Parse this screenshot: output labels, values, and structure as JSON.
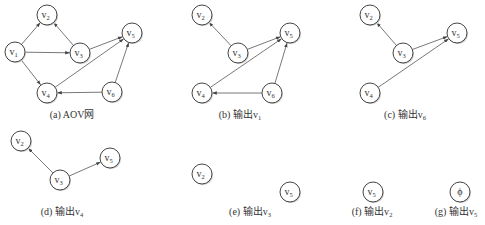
{
  "figure": {
    "node_radius": 10,
    "colors": {
      "node_stroke": "#444444",
      "edge": "#555555",
      "text": "#333333",
      "background": "#ffffff"
    },
    "panels": [
      {
        "id": "a",
        "caption": {
          "prefix": "(a) AOV网",
          "sub": "",
          "x": 72,
          "y": 118
        },
        "nodes": [
          {
            "id": "v1",
            "label": "v",
            "sub": "1",
            "x": 15,
            "y": 52
          },
          {
            "id": "v2",
            "label": "v",
            "sub": "2",
            "x": 47,
            "y": 15
          },
          {
            "id": "v3",
            "label": "v",
            "sub": "3",
            "x": 80,
            "y": 53
          },
          {
            "id": "v4",
            "label": "v",
            "sub": "4",
            "x": 47,
            "y": 93
          },
          {
            "id": "v5",
            "label": "v",
            "sub": "5",
            "x": 132,
            "y": 33
          },
          {
            "id": "v6",
            "label": "v",
            "sub": "6",
            "x": 112,
            "y": 92
          }
        ],
        "edges": [
          {
            "from": "v1",
            "to": "v2"
          },
          {
            "from": "v1",
            "to": "v3"
          },
          {
            "from": "v1",
            "to": "v4"
          },
          {
            "from": "v3",
            "to": "v2"
          },
          {
            "from": "v3",
            "to": "v5"
          },
          {
            "from": "v4",
            "to": "v5"
          },
          {
            "from": "v6",
            "to": "v4"
          },
          {
            "from": "v6",
            "to": "v5"
          }
        ]
      },
      {
        "id": "b",
        "caption": {
          "prefix": "(b) 输出v",
          "sub": "1",
          "x": 240,
          "y": 118
        },
        "nodes": [
          {
            "id": "v2",
            "label": "v",
            "sub": "2",
            "x": 202,
            "y": 15
          },
          {
            "id": "v3",
            "label": "v",
            "sub": "3",
            "x": 238,
            "y": 53
          },
          {
            "id": "v4",
            "label": "v",
            "sub": "4",
            "x": 202,
            "y": 93
          },
          {
            "id": "v5",
            "label": "v",
            "sub": "5",
            "x": 290,
            "y": 33
          },
          {
            "id": "v6",
            "label": "v",
            "sub": "6",
            "x": 272,
            "y": 93
          }
        ],
        "edges": [
          {
            "from": "v3",
            "to": "v2"
          },
          {
            "from": "v3",
            "to": "v5"
          },
          {
            "from": "v4",
            "to": "v5"
          },
          {
            "from": "v6",
            "to": "v4"
          },
          {
            "from": "v6",
            "to": "v5"
          }
        ]
      },
      {
        "id": "c",
        "caption": {
          "prefix": "(c) 输出v",
          "sub": "6",
          "x": 405,
          "y": 118
        },
        "nodes": [
          {
            "id": "v2",
            "label": "v",
            "sub": "2",
            "x": 370,
            "y": 15
          },
          {
            "id": "v3",
            "label": "v",
            "sub": "3",
            "x": 403,
            "y": 53
          },
          {
            "id": "v4",
            "label": "v",
            "sub": "4",
            "x": 370,
            "y": 93
          },
          {
            "id": "v5",
            "label": "v",
            "sub": "5",
            "x": 457,
            "y": 33
          }
        ],
        "edges": [
          {
            "from": "v3",
            "to": "v2"
          },
          {
            "from": "v3",
            "to": "v5"
          },
          {
            "from": "v4",
            "to": "v5"
          }
        ]
      },
      {
        "id": "d",
        "caption": {
          "prefix": "(d) 输出v",
          "sub": "4",
          "x": 62,
          "y": 215
        },
        "nodes": [
          {
            "id": "v2",
            "label": "v",
            "sub": "2",
            "x": 21,
            "y": 141
          },
          {
            "id": "v3",
            "label": "v",
            "sub": "3",
            "x": 60,
            "y": 180
          },
          {
            "id": "v5",
            "label": "v",
            "sub": "5",
            "x": 110,
            "y": 158
          }
        ],
        "edges": [
          {
            "from": "v3",
            "to": "v2"
          },
          {
            "from": "v3",
            "to": "v5"
          }
        ]
      },
      {
        "id": "e",
        "caption": {
          "prefix": "(e) 输出v",
          "sub": "3",
          "x": 250,
          "y": 215
        },
        "nodes": [
          {
            "id": "v2",
            "label": "v",
            "sub": "2",
            "x": 202,
            "y": 174
          },
          {
            "id": "v5",
            "label": "v",
            "sub": "5",
            "x": 290,
            "y": 192
          }
        ],
        "edges": []
      },
      {
        "id": "f",
        "caption": {
          "prefix": "(f) 输出v",
          "sub": "2",
          "x": 372,
          "y": 215
        },
        "nodes": [
          {
            "id": "v5",
            "label": "v",
            "sub": "5",
            "x": 373,
            "y": 192
          }
        ],
        "edges": []
      },
      {
        "id": "g",
        "caption": {
          "prefix": "(g) 输出v",
          "sub": "5",
          "x": 456,
          "y": 215
        },
        "nodes": [
          {
            "id": "empty",
            "label": "ϕ",
            "sub": "",
            "x": 460,
            "y": 192
          }
        ],
        "edges": []
      }
    ]
  }
}
